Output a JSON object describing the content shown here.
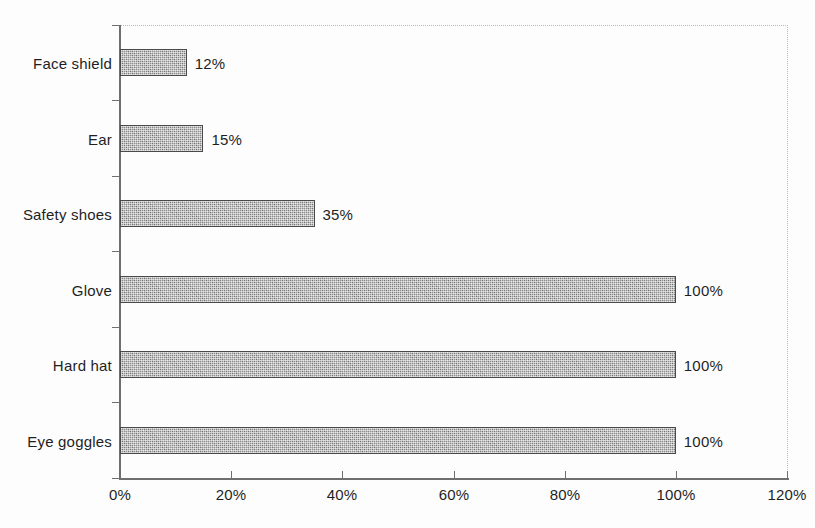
{
  "chart_data": {
    "type": "bar",
    "orientation": "horizontal",
    "title": "",
    "subtitle": "",
    "xlabel": "",
    "ylabel": "",
    "categories": [
      "Eye goggles",
      "Hard hat",
      "Glove",
      "Safety shoes",
      "Ear",
      "Face shield"
    ],
    "values": [
      100,
      100,
      100,
      35,
      15,
      12
    ],
    "data_labels": [
      "100%",
      "100%",
      "100%",
      "35%",
      "15%",
      "12%"
    ],
    "xlim": [
      0,
      120
    ],
    "xticks": [
      0,
      20,
      40,
      60,
      80,
      100,
      120
    ],
    "xtick_labels": [
      "0%",
      "20%",
      "40%",
      "60%",
      "80%",
      "100%",
      "120%"
    ],
    "grid": false,
    "legend": false,
    "legend_position": "none",
    "bar_fill_color": "#8f8f8f",
    "bar_border_color": "#4a4a4a",
    "axis_color": "#6f6f6f",
    "text_color": "#1f1f1f",
    "background_color": "#ffffff"
  },
  "rows": [
    {
      "label": "Face shield",
      "value": 12,
      "data_label": "12%"
    },
    {
      "label": "Ear",
      "value": 15,
      "data_label": "15%"
    },
    {
      "label": "Safety shoes",
      "value": 35,
      "data_label": "35%"
    },
    {
      "label": "Glove",
      "value": 100,
      "data_label": "100%"
    },
    {
      "label": "Hard hat",
      "value": 100,
      "data_label": "100%"
    },
    {
      "label": "Eye goggles",
      "value": 100,
      "data_label": "100%"
    }
  ],
  "axis": {
    "x_tick_labels": [
      "0%",
      "20%",
      "40%",
      "60%",
      "80%",
      "100%",
      "120%"
    ]
  }
}
